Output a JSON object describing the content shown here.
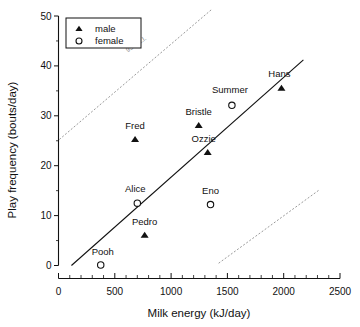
{
  "chart_data": {
    "type": "scatter",
    "title": "",
    "xlabel": "Milk  energy  (kJ/day)",
    "ylabel": "Play frequency (bouts/day)",
    "xlim": [
      0,
      2500
    ],
    "ylim": [
      0,
      50
    ],
    "xticks": [
      0,
      500,
      1000,
      1500,
      2000,
      2500
    ],
    "xtick_labels": [
      "0",
      "500",
      "1000",
      "1500",
      "2000",
      "2500"
    ],
    "yticks": [
      0,
      10,
      20,
      30,
      40,
      50
    ],
    "ytick_labels": [
      "0",
      "10",
      "20",
      "30",
      "40",
      "50"
    ],
    "grid": false,
    "legend_position": "top-left",
    "legend": [
      {
        "key": "male",
        "label": "male",
        "marker": "filled-triangle"
      },
      {
        "key": "female",
        "label": "female",
        "marker": "open-circle"
      }
    ],
    "annotations": [
      {
        "text": "95% c.l.",
        "x": 700,
        "y": 44,
        "rotation": -35,
        "color": "#8a8a8a"
      }
    ],
    "series": [
      {
        "name": "male",
        "marker": "filled-triangle",
        "points": [
          {
            "label": "Fred",
            "x": 680,
            "y": 25.2,
            "label_dx": 0,
            "label_dy": -11
          },
          {
            "label": "Pedro",
            "x": 765,
            "y": 6.0,
            "label_dx": 0,
            "label_dy": -11
          },
          {
            "label": "Bristle",
            "x": 1245,
            "y": 28.0,
            "label_dx": 0,
            "label_dy": -11
          },
          {
            "label": "Ozzie",
            "x": 1325,
            "y": 22.6,
            "label_dx": -4,
            "label_dy": -11
          },
          {
            "label": "Hans",
            "x": 1980,
            "y": 35.5,
            "label_dx": -2,
            "label_dy": -11
          }
        ]
      },
      {
        "name": "female",
        "marker": "open-circle",
        "points": [
          {
            "label": "Pooh",
            "x": 375,
            "y": 0.1,
            "label_dx": 2,
            "label_dy": -10
          },
          {
            "label": "Alice",
            "x": 700,
            "y": 12.5,
            "label_dx": -2,
            "label_dy": -11
          },
          {
            "label": "Eno",
            "x": 1350,
            "y": 12.2,
            "label_dx": 0,
            "label_dy": -11
          },
          {
            "label": "Summer",
            "x": 1540,
            "y": 32.1,
            "label_dx": -2,
            "label_dy": -12
          }
        ]
      }
    ],
    "fit_line": {
      "name": "regression-line",
      "x_start": 115,
      "y_start": 0.0,
      "x_end": 2175,
      "y_end": 41.2
    },
    "confidence_bands": [
      {
        "name": "upper-95-cl",
        "x_start": 10,
        "y_start": 25.3,
        "x_end": 1370,
        "y_end": 51.5
      },
      {
        "name": "lower-95-cl",
        "x_start": 1425,
        "y_start": 0.5,
        "x_end": 2325,
        "y_end": 15.3
      }
    ]
  }
}
